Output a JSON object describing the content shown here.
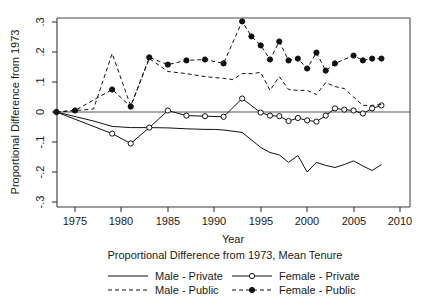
{
  "chart_data": {
    "type": "line",
    "title": "",
    "xlabel": "Year",
    "ylabel": "Proportional Difference from 1973",
    "subtitle": "Proportional Difference from 1973, Mean Tenure",
    "xlim": [
      1972.5,
      2010.5
    ],
    "ylim": [
      -0.3,
      0.3
    ],
    "xticks": [
      1975,
      1980,
      1985,
      1990,
      1995,
      2000,
      2005,
      2010
    ],
    "xticklabels": [
      "1975",
      "1980",
      "1985",
      "1990",
      "1995",
      "2000",
      "2005",
      "2010"
    ],
    "yticks": [
      0.3,
      0.2,
      0.1,
      0,
      -0.1,
      -0.2,
      -0.3
    ],
    "yticklabels": [
      ".3",
      ".2",
      ".1",
      "0",
      "-.1",
      "-.2",
      "-.3"
    ],
    "grid": false,
    "zero_reference_line": 0,
    "legend_position": "below",
    "series": [
      {
        "name": "Male - Private",
        "style": "solid",
        "marker": "none",
        "color": "#111111",
        "x": [
          1973,
          1975,
          1977,
          1979,
          1981,
          1983,
          1985,
          1987,
          1988,
          1989,
          1990,
          1991,
          1992,
          1993,
          1994,
          1995,
          1996,
          1997,
          1998,
          1999,
          2000,
          2001,
          2002,
          2003,
          2004,
          2005,
          2006,
          2007,
          2008
        ],
        "y": [
          0.0,
          -0.015,
          -0.03,
          -0.048,
          -0.052,
          -0.052,
          -0.053,
          -0.056,
          -0.057,
          -0.058,
          -0.058,
          -0.06,
          -0.064,
          -0.068,
          -0.093,
          -0.118,
          -0.135,
          -0.143,
          -0.168,
          -0.145,
          -0.2,
          -0.168,
          -0.178,
          -0.185,
          -0.175,
          -0.163,
          -0.18,
          -0.195,
          -0.175
        ]
      },
      {
        "name": "Female - Private",
        "style": "solid",
        "marker": "open-circle",
        "color": "#111111",
        "x": [
          1973,
          1979,
          1981,
          1983,
          1985,
          1987,
          1989,
          1991,
          1993,
          1995,
          1996,
          1997,
          1998,
          1999,
          2000,
          2001,
          2002,
          2003,
          2004,
          2005,
          2006,
          2007,
          2008
        ],
        "y": [
          0.0,
          -0.072,
          -0.105,
          -0.052,
          0.005,
          -0.012,
          -0.014,
          -0.016,
          0.045,
          -0.002,
          -0.012,
          -0.014,
          -0.03,
          -0.02,
          -0.028,
          -0.032,
          -0.012,
          0.012,
          0.008,
          0.005,
          -0.005,
          0.012,
          0.022
        ]
      },
      {
        "name": "Male - Public",
        "style": "dashed",
        "marker": "none",
        "color": "#111111",
        "x": [
          1973,
          1975,
          1977,
          1979,
          1981,
          1983,
          1985,
          1987,
          1989,
          1990,
          1991,
          1992,
          1993,
          1994,
          1995,
          1996,
          1997,
          1998,
          1999,
          2000,
          2001,
          2002,
          2003,
          2004,
          2005,
          2006,
          2007,
          2008
        ],
        "y": [
          0.0,
          0.005,
          0.01,
          0.195,
          0.02,
          0.178,
          0.135,
          0.128,
          0.118,
          0.115,
          0.112,
          0.108,
          0.128,
          0.128,
          0.132,
          0.072,
          0.118,
          0.075,
          0.072,
          0.072,
          0.058,
          0.098,
          0.085,
          0.078,
          0.05,
          0.022,
          0.022,
          0.025
        ]
      },
      {
        "name": "Female - Public",
        "style": "dashed",
        "marker": "filled-circle",
        "color": "#111111",
        "x": [
          1973,
          1975,
          1979,
          1981,
          1983,
          1985,
          1987,
          1989,
          1991,
          1993,
          1994,
          1995,
          1996,
          1997,
          1998,
          1999,
          2000,
          2001,
          2002,
          2003,
          2005,
          2006,
          2007,
          2008
        ],
        "y": [
          0.0,
          0.005,
          0.075,
          0.018,
          0.182,
          0.158,
          0.172,
          0.175,
          0.162,
          0.302,
          0.252,
          0.222,
          0.175,
          0.235,
          0.172,
          0.178,
          0.145,
          0.198,
          0.138,
          0.162,
          0.188,
          0.172,
          0.178,
          0.178
        ]
      }
    ]
  },
  "legend": {
    "entries": [
      {
        "label": "Male - Private",
        "style": "solid",
        "marker": "none"
      },
      {
        "label": "Female - Private",
        "style": "solid",
        "marker": "open-circle"
      },
      {
        "label": "Male - Public",
        "style": "dashed",
        "marker": "none"
      },
      {
        "label": "Female - Public",
        "style": "dashed",
        "marker": "filled-circle"
      }
    ]
  }
}
